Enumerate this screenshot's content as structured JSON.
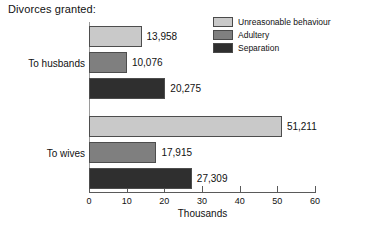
{
  "chart": {
    "title": "Divorces granted:",
    "xlabel": "Thousands"
  },
  "legend": {
    "items": [
      {
        "label": "Unreasonable behaviour",
        "color": "#c9c9c9"
      },
      {
        "label": "Adultery",
        "color": "#7f7f7f"
      },
      {
        "label": "Separation",
        "color": "#2f2f2f"
      }
    ]
  },
  "axis": {
    "ticks": [
      {
        "value": 0,
        "label": "0"
      },
      {
        "value": 10,
        "label": "10"
      },
      {
        "value": 20,
        "label": "20"
      },
      {
        "value": 30,
        "label": "30"
      },
      {
        "value": 40,
        "label": "40"
      },
      {
        "value": 50,
        "label": "50"
      },
      {
        "value": 60,
        "label": "60"
      }
    ]
  },
  "groups": [
    {
      "label": "To husbands",
      "bars": [
        {
          "series": "Unreasonable behaviour",
          "value": 13958,
          "label": "13,958",
          "color": "#c9c9c9"
        },
        {
          "series": "Adultery",
          "value": 10076,
          "label": "10,076",
          "color": "#7f7f7f"
        },
        {
          "series": "Separation",
          "value": 20275,
          "label": "20,275",
          "color": "#2f2f2f"
        }
      ]
    },
    {
      "label": "To wives",
      "bars": [
        {
          "series": "Unreasonable behaviour",
          "value": 51211,
          "label": "51,211",
          "color": "#c9c9c9"
        },
        {
          "series": "Adultery",
          "value": 17915,
          "label": "17,915",
          "color": "#7f7f7f"
        },
        {
          "series": "Separation",
          "value": 27309,
          "label": "27,309",
          "color": "#2f2f2f"
        }
      ]
    }
  ],
  "chart_data": {
    "type": "bar",
    "orientation": "horizontal",
    "title": "Divorces granted:",
    "xlabel": "Thousands",
    "ylabel": "",
    "xlim": [
      0,
      60
    ],
    "xticks": [
      0,
      10,
      20,
      30,
      40,
      50,
      60
    ],
    "xtick_unit": "thousands",
    "grid": false,
    "legend_position": "top-right",
    "categories": [
      "To husbands",
      "To wives"
    ],
    "series": [
      {
        "name": "Unreasonable behaviour",
        "color": "#c9c9c9",
        "values": [
          13958,
          51211
        ]
      },
      {
        "name": "Adultery",
        "color": "#7f7f7f",
        "values": [
          10076,
          17915
        ]
      },
      {
        "name": "Separation",
        "color": "#2f2f2f",
        "values": [
          20275,
          27309
        ]
      }
    ],
    "data_labels": [
      [
        "13,958",
        "51,211"
      ],
      [
        "10,076",
        "17,915"
      ],
      [
        "20,275",
        "27,309"
      ]
    ]
  }
}
